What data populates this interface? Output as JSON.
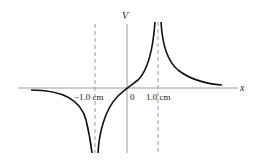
{
  "diagram": {
    "axes": {
      "x_label": "x",
      "y_label": "V",
      "tick_labels": [
        "−1.0 cm",
        "0",
        "1.0 cm"
      ]
    },
    "asymptotes": [
      {
        "x": "-1.0 cm",
        "style": "dashed"
      },
      {
        "x": "1.0 cm",
        "style": "dashed"
      }
    ],
    "curve": {
      "description": "Potential diverges to -infinity at x = -1.0 cm and +infinity at x = +1.0 cm, passes through origin, approaches 0 at large |x|",
      "color": "#111111"
    },
    "colors": {
      "axis": "#999999",
      "dashed": "#999999",
      "curve": "#111111"
    }
  }
}
